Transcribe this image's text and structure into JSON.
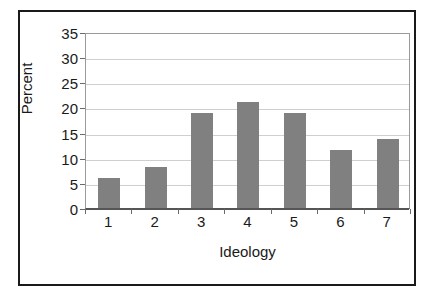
{
  "chart_data": {
    "type": "bar",
    "title": "",
    "subtitle": "",
    "categories": [
      "1",
      "2",
      "3",
      "4",
      "5",
      "6",
      "7"
    ],
    "values": [
      6.0,
      8.2,
      18.8,
      21.0,
      18.8,
      11.6,
      13.7
    ],
    "xlabel": "Ideology",
    "ylabel": "Percent",
    "ylim": [
      0,
      35
    ],
    "ytick_values": [
      0,
      5,
      10,
      15,
      20,
      25,
      30,
      35
    ],
    "ytick_labels": [
      "0",
      "5",
      "10",
      "15",
      "20",
      "25",
      "30",
      "35"
    ],
    "grid": "horizontal",
    "legend": "none",
    "annotations": [],
    "colors": {
      "bar": "#808080",
      "gridline": "#cfcfcf",
      "axis": "#555555",
      "frame": "#1a1a1a",
      "background": "#ffffff",
      "text": "#1a1a1a"
    }
  }
}
